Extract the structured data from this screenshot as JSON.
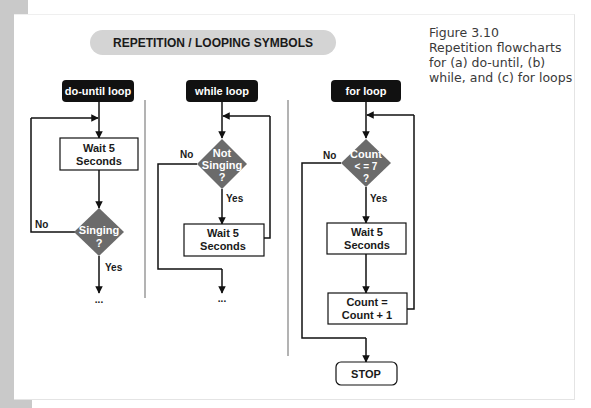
{
  "figure": {
    "number": "Figure 3.10",
    "caption_lines": [
      "Repetition flowcharts",
      "for (a) do-until, (b)",
      "while, and (c) for loops"
    ]
  },
  "banner": {
    "title": "REPETITION / LOOPING SYMBOLS"
  },
  "colors": {
    "diamond": "#6b6b6b",
    "label_bg": "#111111",
    "banner": "#d4d4d4",
    "line": "#111111",
    "divider": "#9a9a9a"
  },
  "do_until": {
    "label": "do-until loop",
    "process": [
      "Wait 5",
      "Seconds"
    ],
    "decision": [
      "Singing",
      "?"
    ],
    "no": "No",
    "yes": "Yes",
    "continuation": "..."
  },
  "while_loop": {
    "label": "while loop",
    "decision": [
      "Not",
      "Singing",
      "?"
    ],
    "process": [
      "Wait 5",
      "Seconds"
    ],
    "no": "No",
    "yes": "Yes",
    "continuation": "..."
  },
  "for_loop": {
    "label": "for loop",
    "decision": [
      "Count",
      "< = 7",
      "?"
    ],
    "process": [
      "Wait 5",
      "Seconds"
    ],
    "increment": [
      "Count =",
      "Count + 1"
    ],
    "no": "No",
    "yes": "Yes",
    "terminal": "STOP"
  }
}
